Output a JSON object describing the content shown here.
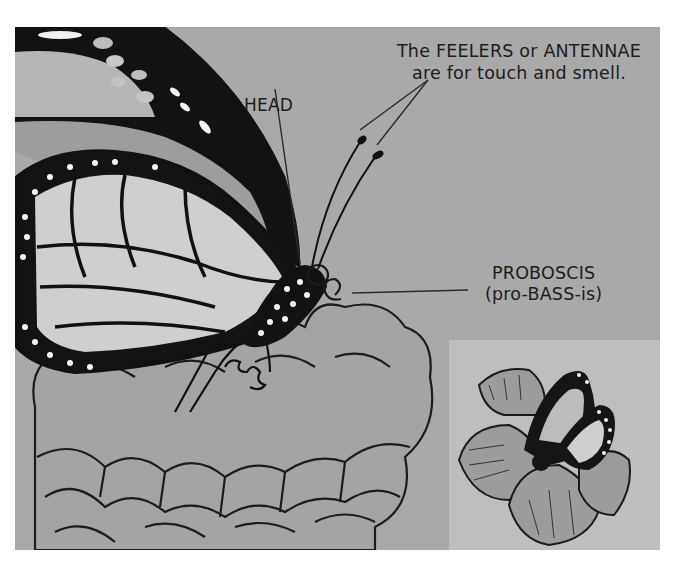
{
  "illustration": {
    "subject": "monarch butterfly on flower",
    "style": "grayscale hand-drawn illustration",
    "colors": {
      "page_background": "#ffffff",
      "panel_background": "#a9a9a9",
      "inset_background": "#bebebe",
      "ink": "#1c1c1c",
      "wing_light": "#d2d2d2",
      "wing_mid": "#b4b4b4",
      "flower": "#9a9a9a"
    }
  },
  "labels": {
    "feelers": {
      "line1": "The FEELERS or ANTENNAE",
      "line2": "are for touch and smell."
    },
    "head": "HEAD",
    "proboscis": {
      "term": "PROBOSCIS",
      "pronunciation": "(pro-BASS-is)"
    }
  },
  "inset": {
    "subject": "butterfly on flower, small view"
  }
}
